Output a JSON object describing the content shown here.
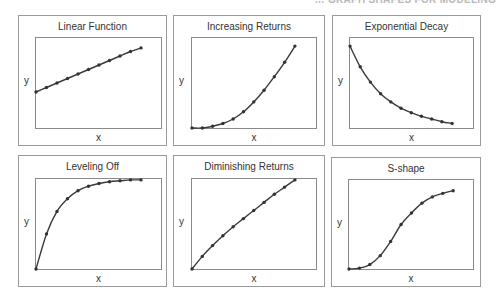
{
  "header": {
    "text": "… GRAPH SHAPES FOR MODELING"
  },
  "chart_data": [
    {
      "type": "line",
      "title": "Linear Function",
      "xlabel": "x",
      "ylabel": "y",
      "grid": false,
      "x": [
        0,
        1,
        2,
        3,
        4,
        5,
        6,
        7,
        8,
        9,
        10
      ],
      "values": [
        0.4,
        0.45,
        0.5,
        0.55,
        0.6,
        0.65,
        0.7,
        0.75,
        0.8,
        0.85,
        0.89
      ],
      "x_extent": 0.84
    },
    {
      "type": "line",
      "title": "Increasing Returns",
      "xlabel": "x",
      "ylabel": "y",
      "grid": false,
      "x": [
        0,
        1,
        2,
        3,
        4,
        5,
        6,
        7,
        8,
        9,
        10
      ],
      "values": [
        0.0,
        0.0,
        0.02,
        0.05,
        0.1,
        0.18,
        0.29,
        0.42,
        0.57,
        0.73,
        0.91
      ],
      "x_extent": 0.83
    },
    {
      "type": "line",
      "title": "Exponential Decay",
      "xlabel": "x",
      "ylabel": "y",
      "grid": false,
      "x": [
        0,
        1,
        2,
        3,
        4,
        5,
        6,
        7,
        8,
        9,
        10
      ],
      "values": [
        0.91,
        0.68,
        0.51,
        0.38,
        0.29,
        0.22,
        0.17,
        0.13,
        0.1,
        0.07,
        0.05
      ],
      "x_extent": 0.83
    },
    {
      "type": "line",
      "title": "Leveling Off",
      "xlabel": "x",
      "ylabel": "y",
      "grid": false,
      "x": [
        0,
        1,
        2,
        3,
        4,
        5,
        6,
        7,
        8,
        9,
        10
      ],
      "values": [
        0.0,
        0.39,
        0.64,
        0.78,
        0.87,
        0.92,
        0.95,
        0.97,
        0.98,
        0.99,
        0.99
      ],
      "x_extent": 0.84
    },
    {
      "type": "line",
      "title": "Diminishing Returns",
      "xlabel": "x",
      "ylabel": "y",
      "grid": false,
      "x": [
        0,
        1,
        2,
        3,
        4,
        5,
        6,
        7,
        8,
        9,
        10
      ],
      "values": [
        0.0,
        0.14,
        0.26,
        0.37,
        0.47,
        0.56,
        0.65,
        0.74,
        0.83,
        0.91,
        0.99
      ],
      "x_extent": 0.83
    },
    {
      "type": "line",
      "title": "S-shape",
      "xlabel": "x",
      "ylabel": "y",
      "grid": false,
      "x": [
        0,
        1,
        2,
        3,
        4,
        5,
        6,
        7,
        8,
        9,
        10
      ],
      "values": [
        0.0,
        0.01,
        0.05,
        0.15,
        0.31,
        0.5,
        0.63,
        0.74,
        0.81,
        0.85,
        0.88
      ],
      "x_extent": 0.84
    }
  ],
  "panels": [
    {
      "title": "Linear Function",
      "xlabel": "x",
      "ylabel": "y"
    },
    {
      "title": "Increasing Returns",
      "xlabel": "x",
      "ylabel": "y"
    },
    {
      "title": "Exponential Decay",
      "xlabel": "x",
      "ylabel": "y"
    },
    {
      "title": "Leveling Off",
      "xlabel": "x",
      "ylabel": "y"
    },
    {
      "title": "Diminishing Returns",
      "xlabel": "x",
      "ylabel": "y"
    },
    {
      "title": "S-shape",
      "xlabel": "x",
      "ylabel": "y"
    }
  ],
  "colors": {
    "line": "#3a3a3a",
    "marker": "#333333",
    "frame": "#9a9a9a"
  }
}
